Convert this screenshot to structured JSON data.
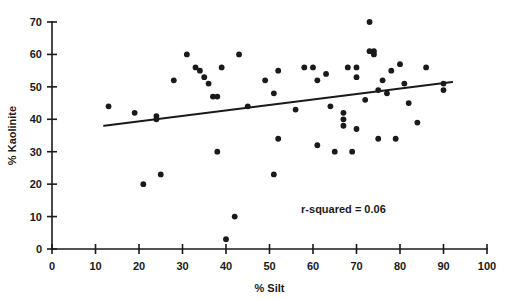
{
  "chart_data": {
    "type": "scatter",
    "title": "",
    "xlabel": "% Silt",
    "ylabel": "% Kaolinite",
    "xlim": [
      0,
      100
    ],
    "ylim": [
      0,
      70
    ],
    "xticks": [
      0,
      10,
      20,
      30,
      40,
      50,
      60,
      70,
      80,
      90,
      100
    ],
    "yticks": [
      0,
      10,
      20,
      30,
      40,
      50,
      60,
      70
    ],
    "grid": false,
    "legend": null,
    "annotations": [
      {
        "name": "r-squared-annotation",
        "text": "r-squared = 0.06",
        "x": 67,
        "y": 11
      }
    ],
    "trendline": {
      "name": "regression-line",
      "type": "linear",
      "x_start": 12,
      "y_start": 38,
      "x_end": 92,
      "y_end": 51.5,
      "r_squared": 0.06
    },
    "points": [
      {
        "x": 13,
        "y": 44
      },
      {
        "x": 19,
        "y": 42
      },
      {
        "x": 21,
        "y": 20
      },
      {
        "x": 24,
        "y": 41
      },
      {
        "x": 24,
        "y": 40
      },
      {
        "x": 25,
        "y": 23
      },
      {
        "x": 28,
        "y": 52
      },
      {
        "x": 31,
        "y": 60
      },
      {
        "x": 33,
        "y": 56
      },
      {
        "x": 34,
        "y": 55
      },
      {
        "x": 35,
        "y": 53
      },
      {
        "x": 36,
        "y": 51
      },
      {
        "x": 37,
        "y": 47
      },
      {
        "x": 38,
        "y": 47
      },
      {
        "x": 38,
        "y": 30
      },
      {
        "x": 39,
        "y": 56
      },
      {
        "x": 40,
        "y": 3
      },
      {
        "x": 42,
        "y": 10
      },
      {
        "x": 43,
        "y": 60
      },
      {
        "x": 45,
        "y": 44
      },
      {
        "x": 49,
        "y": 52
      },
      {
        "x": 51,
        "y": 48
      },
      {
        "x": 51,
        "y": 23
      },
      {
        "x": 52,
        "y": 34
      },
      {
        "x": 52,
        "y": 55
      },
      {
        "x": 56,
        "y": 43
      },
      {
        "x": 58,
        "y": 56
      },
      {
        "x": 60,
        "y": 56
      },
      {
        "x": 61,
        "y": 52
      },
      {
        "x": 61,
        "y": 32
      },
      {
        "x": 63,
        "y": 54
      },
      {
        "x": 64,
        "y": 44
      },
      {
        "x": 65,
        "y": 30
      },
      {
        "x": 67,
        "y": 40
      },
      {
        "x": 67,
        "y": 42
      },
      {
        "x": 67,
        "y": 38
      },
      {
        "x": 68,
        "y": 56
      },
      {
        "x": 69,
        "y": 30
      },
      {
        "x": 70,
        "y": 37
      },
      {
        "x": 70,
        "y": 53
      },
      {
        "x": 70,
        "y": 56
      },
      {
        "x": 72,
        "y": 46
      },
      {
        "x": 73,
        "y": 70
      },
      {
        "x": 73,
        "y": 61
      },
      {
        "x": 74,
        "y": 60
      },
      {
        "x": 74,
        "y": 61
      },
      {
        "x": 75,
        "y": 49
      },
      {
        "x": 75,
        "y": 34
      },
      {
        "x": 76,
        "y": 52
      },
      {
        "x": 77,
        "y": 48
      },
      {
        "x": 78,
        "y": 55
      },
      {
        "x": 79,
        "y": 34
      },
      {
        "x": 80,
        "y": 57
      },
      {
        "x": 81,
        "y": 51
      },
      {
        "x": 82,
        "y": 45
      },
      {
        "x": 84,
        "y": 39
      },
      {
        "x": 86,
        "y": 56
      },
      {
        "x": 90,
        "y": 49
      },
      {
        "x": 90,
        "y": 51
      }
    ]
  }
}
